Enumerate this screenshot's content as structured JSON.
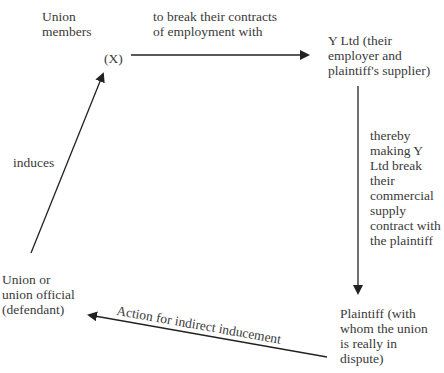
{
  "diagram": {
    "nodes": {
      "union_members": "Union\nmembers",
      "x_label": "(X)",
      "y_ltd": "Y Ltd (their\nemployer and\nplaintiff's supplier)",
      "plaintiff": "Plaintiff (with\nwhom the union\nis really in\ndispute)",
      "defendant": "Union or\nunion official\n(defendant)"
    },
    "edges": {
      "x_to_y": "to break their contracts\nof employment with",
      "y_to_plaintiff": "thereby\nmaking Y\nLtd break\ntheir\ncommercial\nsupply\ncontract with\nthe plaintiff",
      "plaintiff_to_defendant": "Action for indirect inducement",
      "defendant_to_x": "induces"
    },
    "colors": {
      "line": "#222222",
      "text": "#3a3a3a"
    }
  }
}
